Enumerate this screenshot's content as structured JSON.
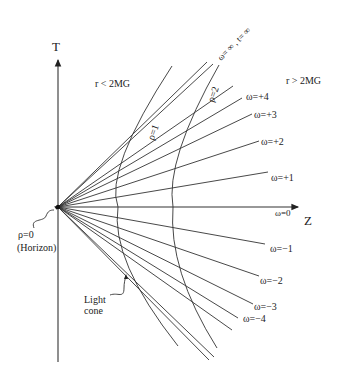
{
  "diagram": {
    "axes": {
      "vertical_label": "T",
      "horizontal_label": "Z"
    },
    "regions": {
      "inside": "r  <  2MG",
      "outside": "r  >  2MG"
    },
    "origin_label": {
      "line1": "ρ=0",
      "line2": "(Horizon)"
    },
    "light_cone_label": {
      "line1": "Light",
      "line2": "cone"
    },
    "rho_curves": [
      {
        "label": "ρ=1"
      },
      {
        "label": "ρ=2"
      }
    ],
    "omega_lines": {
      "infinity": "ω= ∞ ,  t= ∞",
      "plus4": "ω=+4",
      "plus3": "ω=+3",
      "plus2": "ω=+2",
      "plus1": "ω=+1",
      "zero": "ω=0",
      "minus1": "ω=−1",
      "minus2": "ω=−2",
      "minus3": "ω=−3",
      "minus4": "ω=−4"
    },
    "colors": {
      "line": "#333333",
      "text": "#222222",
      "background": "#ffffff"
    }
  }
}
